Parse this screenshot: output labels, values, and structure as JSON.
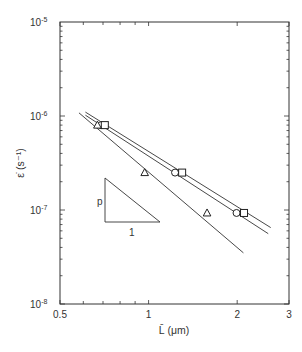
{
  "chart_data": {
    "type": "scatter",
    "title": "",
    "xlabel": "L̄ (μm)",
    "ylabel": "ε̇ (s⁻¹)",
    "xscale": "log",
    "yscale": "log",
    "xlim": [
      0.5,
      3
    ],
    "ylim": [
      1e-08,
      1e-05
    ],
    "grid": false,
    "legend": "none",
    "x_ticks": [
      {
        "value": 0.5,
        "label": "0.5"
      },
      {
        "value": 1,
        "label": "1"
      },
      {
        "value": 2,
        "label": "2"
      },
      {
        "value": 3,
        "label": "3"
      }
    ],
    "y_ticks": [
      {
        "value": 1e-05,
        "base": "10",
        "exp": "-5"
      },
      {
        "value": 1e-06,
        "base": "10",
        "exp": "-6"
      },
      {
        "value": 1e-07,
        "base": "10",
        "exp": "-7"
      },
      {
        "value": 1e-08,
        "base": "10",
        "exp": "-8"
      }
    ],
    "series": [
      {
        "name": "circles",
        "marker": "circle",
        "points": [
          [
            0.69,
            8e-07
          ],
          [
            1.23,
            2.5e-07
          ],
          [
            1.99,
            9.3e-08
          ]
        ]
      },
      {
        "name": "squares",
        "marker": "square",
        "points": [
          [
            0.71,
            8e-07
          ],
          [
            1.3,
            2.5e-07
          ],
          [
            2.11,
            9.3e-08
          ]
        ]
      },
      {
        "name": "triangles",
        "marker": "triangle",
        "points": [
          [
            0.67,
            8e-07
          ],
          [
            0.97,
            2.5e-07
          ],
          [
            1.58,
            9.3e-08
          ]
        ]
      }
    ],
    "fit_lines": [
      {
        "name": "upper-fit-1",
        "from": [
          0.61,
          1.1e-06
        ],
        "to": [
          2.6,
          6.5e-08
        ]
      },
      {
        "name": "upper-fit-2",
        "from": [
          0.61,
          1.02e-06
        ],
        "to": [
          2.55,
          5.6e-08
        ]
      },
      {
        "name": "lower-fit",
        "from": [
          0.58,
          1.08e-06
        ],
        "to": [
          2.1,
          3.5e-08
        ]
      }
    ],
    "annotations": [
      {
        "type": "slope-triangle",
        "vertical_label": "p",
        "horizontal_label": "1"
      }
    ]
  }
}
